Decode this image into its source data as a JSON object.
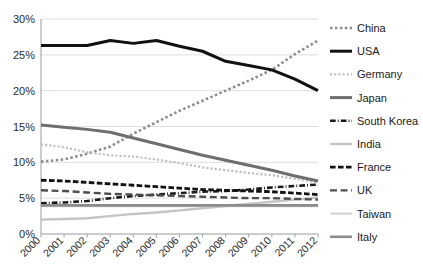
{
  "chart_data": {
    "type": "line",
    "title": "",
    "xlabel": "",
    "ylabel": "",
    "x": [
      2000,
      2001,
      2002,
      2003,
      2004,
      2005,
      2006,
      2007,
      2008,
      2009,
      2010,
      2011,
      2012
    ],
    "xtick_labels": [
      "2000",
      "2001",
      "2002",
      "2003",
      "2004",
      "2005",
      "2006",
      "2007",
      "2008",
      "2009",
      "2010",
      "2011",
      "2012"
    ],
    "ytick_labels": [
      "0%",
      "5%",
      "10%",
      "15%",
      "20%",
      "25%",
      "30%"
    ],
    "ytick_values": [
      0,
      5,
      10,
      15,
      20,
      25,
      30
    ],
    "ylim": [
      0,
      30
    ],
    "xlim": [
      2000,
      2012
    ],
    "grid": "horizontal",
    "legend_position": "right",
    "series": [
      {
        "name": "China",
        "color": "#8c8c8c",
        "style": "dotted",
        "width": 2.6,
        "values": [
          10.1,
          10.4,
          11.2,
          12.2,
          14.0,
          15.6,
          17.2,
          18.6,
          20.0,
          21.4,
          22.9,
          25.1,
          27.0
        ]
      },
      {
        "name": "USA",
        "color": "#111111",
        "style": "solid",
        "width": 3.0,
        "values": [
          26.3,
          26.3,
          26.3,
          27.0,
          26.6,
          27.0,
          26.2,
          25.5,
          24.1,
          23.5,
          22.9,
          21.6,
          20.0
        ]
      },
      {
        "name": "Germany",
        "color": "#bdbdbd",
        "style": "dotted",
        "width": 2.2,
        "values": [
          12.5,
          12.1,
          11.4,
          11.0,
          10.8,
          10.4,
          9.9,
          9.3,
          8.9,
          8.5,
          8.2,
          7.7,
          7.2
        ]
      },
      {
        "name": "Japan",
        "color": "#6e6e6e",
        "style": "solid",
        "width": 3.0,
        "values": [
          15.2,
          14.9,
          14.6,
          14.2,
          13.4,
          12.6,
          11.8,
          11.0,
          10.3,
          9.6,
          8.9,
          8.1,
          7.4
        ]
      },
      {
        "name": "South Korea",
        "color": "#1a1a1a",
        "style": "dashdot",
        "width": 2.6,
        "values": [
          4.3,
          4.4,
          4.6,
          5.0,
          5.3,
          5.5,
          5.7,
          5.9,
          6.0,
          6.2,
          6.5,
          6.7,
          6.9
        ]
      },
      {
        "name": "India",
        "color": "#c4c4c4",
        "style": "solid",
        "width": 2.4,
        "values": [
          2.0,
          2.1,
          2.2,
          2.5,
          2.8,
          3.0,
          3.3,
          3.6,
          3.9,
          4.2,
          4.5,
          4.8,
          5.1
        ]
      },
      {
        "name": "France",
        "color": "#111111",
        "style": "dashed",
        "width": 2.8,
        "values": [
          7.5,
          7.4,
          7.2,
          7.0,
          6.8,
          6.6,
          6.4,
          6.2,
          6.1,
          6.0,
          5.9,
          5.7,
          5.5
        ]
      },
      {
        "name": "UK",
        "color": "#4d4d4d",
        "style": "longdash",
        "width": 2.4,
        "values": [
          6.1,
          6.0,
          5.8,
          5.6,
          5.5,
          5.4,
          5.3,
          5.2,
          5.1,
          5.0,
          5.0,
          4.9,
          4.8
        ]
      },
      {
        "name": "Taiwan",
        "color": "#d4d4d4",
        "style": "solid",
        "width": 2.2,
        "values": [
          3.9,
          3.9,
          3.9,
          3.9,
          3.9,
          3.9,
          3.9,
          3.9,
          3.9,
          3.9,
          3.9,
          3.9,
          3.9
        ]
      },
      {
        "name": "Italy",
        "color": "#8c8c8c",
        "style": "solid",
        "width": 2.6,
        "values": [
          4.0,
          4.0,
          4.0,
          4.0,
          4.0,
          4.0,
          4.0,
          4.0,
          4.0,
          4.0,
          4.0,
          4.0,
          4.0
        ]
      }
    ]
  },
  "legend": {
    "items": [
      {
        "label": "China"
      },
      {
        "label": "USA"
      },
      {
        "label": "Germany"
      },
      {
        "label": "Japan"
      },
      {
        "label": "South Korea"
      },
      {
        "label": "India"
      },
      {
        "label": "France"
      },
      {
        "label": "UK"
      },
      {
        "label": "Taiwan"
      },
      {
        "label": "Italy"
      }
    ]
  },
  "colors": {
    "background": "#ffffff",
    "grid": "#d9d9d9",
    "axis": "#9a9a9a",
    "text": "#1a1a1a"
  }
}
